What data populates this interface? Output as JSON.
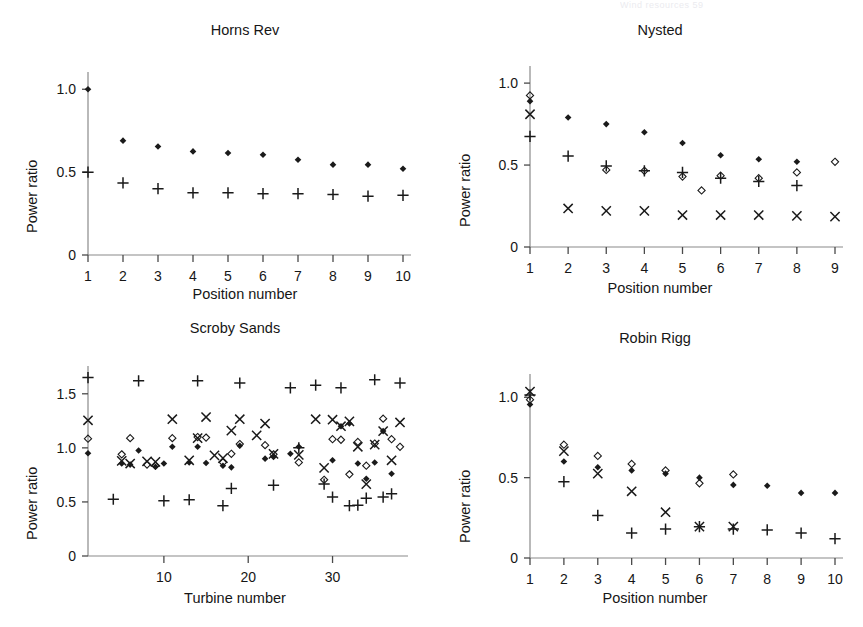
{
  "running_head": "Wind resources    59",
  "figure": {
    "y_axis_label": "Power ratio",
    "panels_count": 4
  },
  "panels": [
    {
      "id": "horns-rev",
      "title": "Horns Rev",
      "xlabel": "Position number",
      "ylabel": "Power ratio",
      "xticklabels": [
        "1",
        "2",
        "3",
        "4",
        "5",
        "6",
        "7",
        "8",
        "9",
        "10"
      ],
      "yticklabels": [
        "0",
        "0.5",
        "1.0"
      ]
    },
    {
      "id": "nysted",
      "title": "Nysted",
      "xlabel": "Position number",
      "ylabel": "Power ratio",
      "xticklabels": [
        "1",
        "2",
        "3",
        "4",
        "5",
        "6",
        "7",
        "8",
        "9"
      ],
      "yticklabels": [
        "0",
        "0.5",
        "1.0"
      ]
    },
    {
      "id": "scroby-sands",
      "title": "Scroby Sands",
      "xlabel": "Turbine number",
      "ylabel": "Power ratio",
      "xticklabels": [
        "10",
        "20",
        "30"
      ],
      "yticklabels": [
        "0",
        "0.5",
        "1.0",
        "1.5"
      ]
    },
    {
      "id": "robin-rigg",
      "title": "Robin Rigg",
      "xlabel": "Position number",
      "ylabel": "Power ratio",
      "xticklabels": [
        "1",
        "2",
        "3",
        "4",
        "5",
        "6",
        "7",
        "8",
        "9",
        "10"
      ],
      "yticklabels": [
        "0",
        "0.5",
        "1.0"
      ]
    }
  ],
  "chart_data": [
    {
      "type": "scatter",
      "title": "Horns Rev",
      "xlabel": "Position number",
      "ylabel": "Power ratio",
      "xlim": [
        1,
        10
      ],
      "ylim": [
        0,
        1.08
      ],
      "xticks": [
        1,
        2,
        3,
        4,
        5,
        6,
        7,
        8,
        9,
        10
      ],
      "yticks": [
        0,
        0.5,
        1.0
      ],
      "grid": false,
      "legend": "none",
      "series": [
        {
          "name": "filled-diamond",
          "marker": "filled-diamond",
          "x": [
            1,
            2,
            3,
            4,
            5,
            6,
            7,
            8,
            9,
            10
          ],
          "y": [
            1.0,
            0.69,
            0.655,
            0.625,
            0.615,
            0.605,
            0.575,
            0.545,
            0.545,
            0.52
          ]
        },
        {
          "name": "plus",
          "marker": "plus",
          "x": [
            1,
            2,
            3,
            4,
            5,
            6,
            7,
            8,
            9,
            10
          ],
          "y": [
            0.5,
            0.435,
            0.4,
            0.375,
            0.375,
            0.37,
            0.37,
            0.365,
            0.355,
            0.36
          ]
        }
      ]
    },
    {
      "type": "scatter",
      "title": "Nysted",
      "xlabel": "Position number",
      "ylabel": "Power ratio",
      "xlim": [
        1,
        9
      ],
      "ylim": [
        0,
        1.08
      ],
      "xticks": [
        1,
        2,
        3,
        4,
        5,
        6,
        7,
        8,
        9
      ],
      "yticks": [
        0,
        0.5,
        1.0
      ],
      "grid": false,
      "legend": "none",
      "series": [
        {
          "name": "filled-diamond",
          "marker": "filled-diamond",
          "x": [
            1,
            2,
            3,
            4,
            5,
            6,
            7,
            8
          ],
          "y": [
            0.89,
            0.79,
            0.75,
            0.7,
            0.635,
            0.56,
            0.535,
            0.52
          ]
        },
        {
          "name": "open-diamond",
          "marker": "open-diamond",
          "x": [
            1,
            3,
            4,
            5,
            5.5,
            6,
            7,
            8,
            9
          ],
          "y": [
            0.925,
            0.47,
            0.465,
            0.43,
            0.345,
            0.435,
            0.42,
            0.455,
            0.52
          ]
        },
        {
          "name": "plus",
          "marker": "plus",
          "x": [
            1,
            2,
            3,
            4,
            5,
            6,
            7,
            8
          ],
          "y": [
            0.675,
            0.555,
            0.495,
            0.465,
            0.455,
            0.42,
            0.4,
            0.375
          ]
        },
        {
          "name": "cross",
          "marker": "cross",
          "x": [
            1,
            2,
            3,
            4,
            5,
            6,
            7,
            8,
            9
          ],
          "y": [
            0.81,
            0.235,
            0.22,
            0.22,
            0.195,
            0.195,
            0.195,
            0.19,
            0.185
          ]
        }
      ]
    },
    {
      "type": "scatter",
      "title": "Scroby Sands",
      "xlabel": "Turbine number",
      "ylabel": "Power ratio",
      "xlim": [
        1,
        38
      ],
      "ylim": [
        0,
        1.72
      ],
      "xticks": [
        10,
        20,
        30
      ],
      "yticks": [
        0,
        0.5,
        1.0,
        1.5
      ],
      "grid": false,
      "legend": "none",
      "series": [
        {
          "name": "plus",
          "marker": "plus",
          "x": [
            1,
            4,
            7,
            10,
            13,
            14,
            17,
            18,
            19,
            23,
            25,
            26,
            28,
            29,
            30,
            31,
            32,
            33,
            34,
            35,
            36,
            37,
            38
          ],
          "y": [
            1.65,
            0.525,
            1.62,
            0.51,
            0.52,
            1.62,
            0.465,
            0.625,
            1.6,
            0.655,
            1.555,
            1.0,
            1.58,
            0.665,
            0.545,
            1.555,
            0.465,
            0.47,
            0.535,
            1.63,
            0.545,
            0.575,
            1.6
          ]
        },
        {
          "name": "cross",
          "marker": "cross",
          "x": [
            1,
            5,
            6,
            8,
            9,
            11,
            13,
            14,
            15,
            16,
            17,
            18,
            19,
            21,
            22,
            23,
            26,
            28,
            29,
            30,
            31,
            32,
            33,
            34,
            35,
            36,
            37,
            38
          ],
          "y": [
            1.255,
            0.88,
            0.855,
            0.875,
            0.87,
            1.265,
            0.885,
            1.09,
            1.285,
            0.93,
            0.905,
            1.16,
            1.265,
            1.115,
            1.225,
            0.945,
            0.935,
            1.265,
            0.815,
            1.26,
            1.2,
            1.245,
            1.01,
            0.665,
            1.03,
            1.155,
            0.885,
            1.235
          ]
        },
        {
          "name": "open-diamond",
          "marker": "open-diamond",
          "x": [
            1,
            5,
            6,
            8,
            9,
            11,
            14,
            15,
            17,
            18,
            19,
            22,
            23,
            26,
            29,
            30,
            31,
            32,
            33,
            34,
            35,
            36,
            37,
            38
          ],
          "y": [
            1.085,
            0.94,
            1.09,
            0.845,
            0.835,
            1.09,
            1.1,
            1.095,
            0.865,
            0.945,
            1.035,
            1.025,
            0.94,
            0.865,
            0.705,
            1.08,
            1.075,
            0.755,
            1.055,
            0.835,
            1.04,
            1.27,
            1.08,
            1.01
          ]
        },
        {
          "name": "filled-diamond",
          "marker": "filled-diamond",
          "x": [
            1,
            5,
            6,
            7,
            9,
            10,
            11,
            13,
            14,
            15,
            17,
            18,
            19,
            22,
            23,
            25,
            26,
            30,
            31,
            32,
            33,
            34,
            35,
            36,
            37
          ],
          "y": [
            0.95,
            0.855,
            0.845,
            0.975,
            0.825,
            0.855,
            1.01,
            0.865,
            1.01,
            0.86,
            0.835,
            0.82,
            1.02,
            0.9,
            0.915,
            0.945,
            1.01,
            0.885,
            1.2,
            1.225,
            0.855,
            0.715,
            0.865,
            1.155,
            0.76
          ]
        }
      ]
    },
    {
      "type": "scatter",
      "title": "Robin Rigg",
      "xlabel": "Position number",
      "ylabel": "Power ratio",
      "xlim": [
        1,
        10
      ],
      "ylim": [
        0,
        1.12
      ],
      "xticks": [
        1,
        2,
        3,
        4,
        5,
        6,
        7,
        8,
        9,
        10
      ],
      "yticks": [
        0,
        0.5,
        1.0
      ],
      "grid": false,
      "legend": "none",
      "series": [
        {
          "name": "filled-diamond",
          "marker": "filled-diamond",
          "x": [
            1,
            2,
            3,
            4,
            5,
            6,
            7,
            8,
            9,
            10
          ],
          "y": [
            0.955,
            0.6,
            0.565,
            0.545,
            0.525,
            0.5,
            0.455,
            0.45,
            0.405,
            0.405
          ]
        },
        {
          "name": "open-diamond",
          "marker": "open-diamond",
          "x": [
            1,
            2,
            3,
            4,
            5,
            6,
            7
          ],
          "y": [
            0.985,
            0.705,
            0.635,
            0.585,
            0.545,
            0.465,
            0.52
          ]
        },
        {
          "name": "cross",
          "marker": "cross",
          "x": [
            1,
            2,
            3,
            4,
            5,
            6,
            7
          ],
          "y": [
            1.035,
            0.665,
            0.525,
            0.415,
            0.285,
            0.195,
            0.195
          ]
        },
        {
          "name": "plus",
          "marker": "plus",
          "x": [
            1,
            2,
            3,
            4,
            5,
            6,
            7,
            8,
            9,
            10
          ],
          "y": [
            1.015,
            0.475,
            0.265,
            0.155,
            0.18,
            0.195,
            0.18,
            0.175,
            0.155,
            0.12
          ]
        }
      ]
    }
  ]
}
